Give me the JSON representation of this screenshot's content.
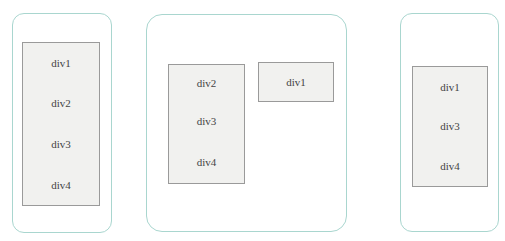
{
  "diagram": {
    "colors": {
      "panel_border": "#a9d6cf",
      "box_border": "#9a9a9a",
      "box_fill": "#f1f1ef",
      "text": "#444444"
    },
    "panels": [
      {
        "id": "panel-1",
        "boxes": [
          {
            "label": "div1"
          },
          {
            "label": "div2"
          },
          {
            "label": "div3"
          },
          {
            "label": "div4"
          }
        ]
      },
      {
        "id": "panel-2",
        "boxes": [
          {
            "label": "div2"
          },
          {
            "label": "div3"
          },
          {
            "label": "div4"
          },
          {
            "label": "div1"
          }
        ]
      },
      {
        "id": "panel-3",
        "boxes": [
          {
            "label": "div1"
          },
          {
            "label": "div3"
          },
          {
            "label": "div4"
          }
        ]
      }
    ]
  }
}
